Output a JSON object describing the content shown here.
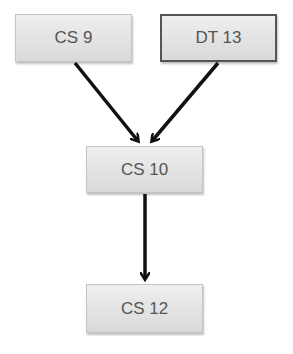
{
  "diagram": {
    "nodes": [
      {
        "id": "cs9",
        "label": "CS 9"
      },
      {
        "id": "dt13",
        "label": "DT 13"
      },
      {
        "id": "cs10",
        "label": "CS 10"
      },
      {
        "id": "cs12",
        "label": "CS 12"
      }
    ],
    "edges": [
      {
        "from": "cs9",
        "to": "cs10"
      },
      {
        "from": "dt13",
        "to": "cs10"
      },
      {
        "from": "cs10",
        "to": "cs12"
      }
    ]
  }
}
